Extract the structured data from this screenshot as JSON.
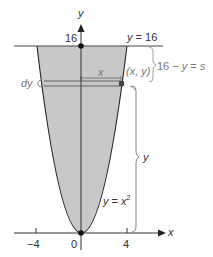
{
  "figure": {
    "type": "parabola-region-diagram",
    "curve": "y = x^2",
    "region_top": "y = 16",
    "fill_color": "#c8c8c8",
    "line_color": "#222222",
    "annotation_color": "#888888"
  },
  "axes": {
    "x_label": "x",
    "y_label": "y",
    "x_ticks": [
      "−4",
      "0",
      "4"
    ],
    "y_ticks": [
      "16"
    ]
  },
  "labels": {
    "top_line": "y = 16",
    "curve_label_base": "y = x",
    "curve_label_exp": "2",
    "point": "(x, y)",
    "distance": "16 − y = s",
    "dy": "dy",
    "strip_x": "x",
    "height_y": "y",
    "y_tick_16": "16"
  }
}
